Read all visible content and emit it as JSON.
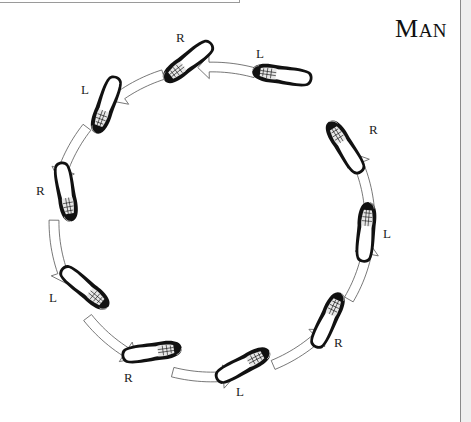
{
  "title": {
    "first": "M",
    "rest": "AN"
  },
  "steps": [
    {
      "id": 1,
      "foot": "L",
      "cx": 282,
      "cy": 75,
      "angle": 8,
      "label_x": 256,
      "label_y": 46
    },
    {
      "id": 2,
      "foot": "R",
      "cx": 188,
      "cy": 62,
      "angle": -38,
      "label_x": 176,
      "label_y": 30
    },
    {
      "id": 3,
      "foot": "L",
      "cx": 106,
      "cy": 105,
      "angle": -70,
      "label_x": 81,
      "label_y": 82
    },
    {
      "id": 4,
      "foot": "R",
      "cx": 66,
      "cy": 192,
      "angle": -100,
      "label_x": 36,
      "label_y": 183
    },
    {
      "id": 5,
      "foot": "L",
      "cx": 85,
      "cy": 288,
      "angle": -140,
      "label_x": 49,
      "label_y": 290
    },
    {
      "id": 6,
      "foot": "R",
      "cx": 152,
      "cy": 352,
      "angle": 172,
      "label_x": 124,
      "label_y": 370
    },
    {
      "id": 7,
      "foot": "L",
      "cx": 243,
      "cy": 365,
      "angle": 152,
      "label_x": 236,
      "label_y": 384
    },
    {
      "id": 8,
      "foot": "R",
      "cx": 328,
      "cy": 320,
      "angle": 115,
      "label_x": 334,
      "label_y": 335
    },
    {
      "id": 9,
      "foot": "L",
      "cx": 366,
      "cy": 232,
      "angle": 95,
      "label_x": 383,
      "label_y": 226
    },
    {
      "id": 10,
      "foot": "R",
      "cx": 345,
      "cy": 147,
      "angle": 58,
      "label_x": 369,
      "label_y": 122
    }
  ],
  "colors": {
    "shoe": "#111111",
    "arrow_stroke": "#555555",
    "arrow_fill": "#ffffff",
    "label": "#222222"
  }
}
